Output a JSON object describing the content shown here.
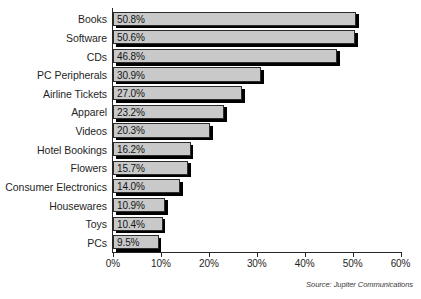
{
  "chart_data": {
    "type": "bar",
    "orientation": "horizontal",
    "title": "",
    "subtitle": "",
    "xlabel": "",
    "ylabel": "",
    "xlim": [
      0,
      60
    ],
    "grid": false,
    "legend": null,
    "categories": [
      "Books",
      "Software",
      "CDs",
      "PC Peripherals",
      "Airline Tickets",
      "Apparel",
      "Videos",
      "Hotel Bookings",
      "Flowers",
      "Consumer Electronics",
      "Housewares",
      "Toys",
      "PCs"
    ],
    "values": [
      50.8,
      50.6,
      46.8,
      30.9,
      27.0,
      23.2,
      20.3,
      16.2,
      15.7,
      14.0,
      10.9,
      10.4,
      9.5
    ],
    "value_labels": [
      "50.8%",
      "50.6%",
      "46.8%",
      "30.9%",
      "27.0%",
      "23.2%",
      "20.3%",
      "16.2%",
      "15.7%",
      "14.0%",
      "10.9%",
      "10.4%",
      "9.5%"
    ],
    "x_ticks": [
      0,
      10,
      20,
      30,
      40,
      50,
      60
    ],
    "x_tick_labels": [
      "0%",
      "10%",
      "20%",
      "30%",
      "40%",
      "50%",
      "60%"
    ],
    "annotations": {
      "source": "Source: Jupiter Communications"
    },
    "colors": {
      "bar_fill": "#c9c9c9",
      "bar_outline": "#2b2b2b",
      "bar_shadow": "#000000",
      "axis": "#262626",
      "text": "#1f1f1f",
      "background": "#ffffff"
    }
  }
}
